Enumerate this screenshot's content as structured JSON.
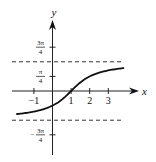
{
  "chart_data": {
    "type": "line",
    "title": "",
    "function": "y = arctan(x - 1)",
    "xlabel": "x",
    "ylabel": "y",
    "xlim": [
      -2,
      3.9
    ],
    "ylim": [
      -2.55,
      2.9
    ],
    "grid": false,
    "x_ticks": [
      {
        "value": -1,
        "label": "−1"
      },
      {
        "value": 1,
        "label": "1"
      },
      {
        "value": 2,
        "label": "2"
      },
      {
        "value": 3,
        "label": "3"
      }
    ],
    "y_ticks": [
      {
        "value": 2.3562,
        "num": "3π",
        "den": "4",
        "sign": ""
      },
      {
        "value": 0.7854,
        "num": "π",
        "den": "4",
        "sign": ""
      },
      {
        "value": -2.3562,
        "num": "3π",
        "den": "4",
        "sign": "−"
      }
    ],
    "asymptotes": [
      1.5708,
      -1.5708
    ],
    "curve_x_range": [
      -1.95,
      3.85
    ],
    "series": [
      {
        "name": "arctan(x-1)",
        "x": [
          -1.95,
          -1.5,
          -1,
          -0.5,
          0,
          0.5,
          1,
          1.5,
          2,
          2.5,
          3,
          3.5,
          3.85
        ],
        "y": [
          -1.2442,
          -1.1903,
          -1.1071,
          -0.9828,
          -0.7854,
          -0.4636,
          0,
          0.4636,
          0.7854,
          0.9828,
          1.1071,
          1.1903,
          1.2334
        ]
      }
    ]
  }
}
